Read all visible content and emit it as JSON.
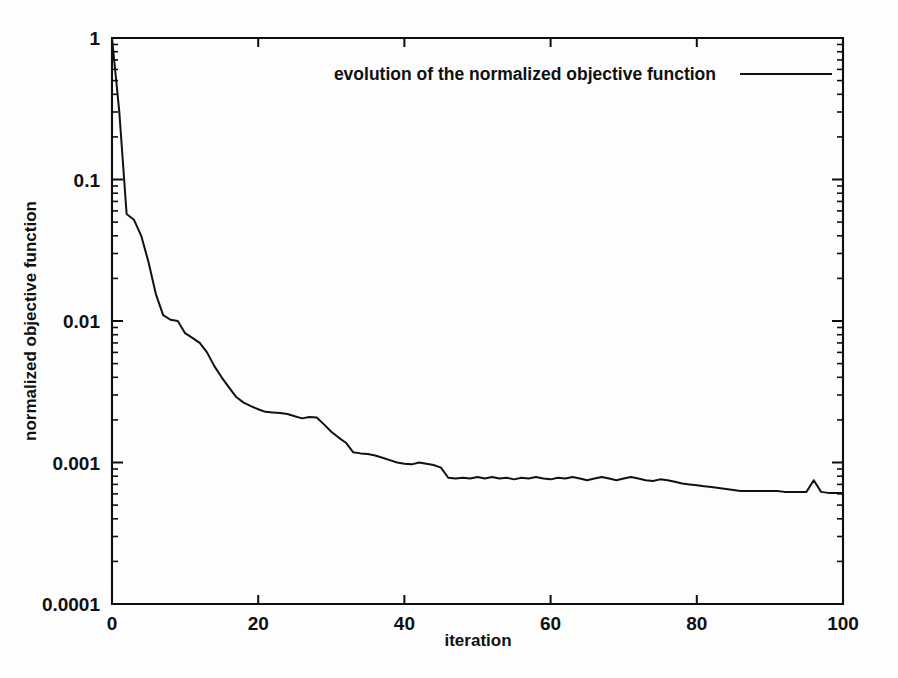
{
  "figure": {
    "background_color": "#fdfdfd",
    "line_color": "#111111",
    "axis_color": "#0d0d0d"
  },
  "chart_data": {
    "type": "line",
    "title": "",
    "subtitle": "",
    "xlabel": "iteration",
    "ylabel": "normalized objective function",
    "xlim": [
      0,
      100
    ],
    "ylim": [
      0.0001,
      1
    ],
    "yscale": "log",
    "xscale": "linear",
    "grid": false,
    "xticks": [
      0,
      20,
      40,
      60,
      80,
      100
    ],
    "xticklabels": [
      "0",
      "20",
      "40",
      "60",
      "80",
      "100"
    ],
    "yticks": [
      1,
      0.1,
      0.01,
      0.001,
      0.0001
    ],
    "yticklabels": [
      "1",
      "0.1",
      "0.01",
      "0.001",
      "0.0001"
    ],
    "legend": {
      "position": "top-right inside",
      "entries": [
        {
          "label": "evolution of the normalized objective function",
          "marker": "line",
          "color": "#111111"
        }
      ]
    },
    "series": [
      {
        "name": "evolution of the normalized objective function",
        "x": [
          0,
          1,
          2,
          3,
          4,
          5,
          6,
          7,
          8,
          9,
          10,
          11,
          12,
          13,
          14,
          15,
          16,
          17,
          18,
          19,
          20,
          21,
          22,
          23,
          24,
          25,
          26,
          27,
          28,
          29,
          30,
          31,
          32,
          33,
          34,
          35,
          36,
          37,
          38,
          39,
          40,
          41,
          42,
          43,
          44,
          45,
          46,
          47,
          48,
          49,
          50,
          51,
          52,
          53,
          54,
          55,
          56,
          57,
          58,
          59,
          60,
          61,
          62,
          63,
          64,
          65,
          66,
          67,
          68,
          69,
          70,
          71,
          72,
          73,
          74,
          75,
          76,
          77,
          78,
          79,
          80,
          81,
          82,
          83,
          84,
          85,
          86,
          87,
          88,
          89,
          90,
          91,
          92,
          93,
          94,
          95,
          96,
          97,
          98,
          99,
          100
        ],
        "y": [
          1.0,
          0.3,
          0.057,
          0.052,
          0.04,
          0.026,
          0.0155,
          0.011,
          0.0102,
          0.01,
          0.0082,
          0.0076,
          0.007,
          0.006,
          0.0048,
          0.004,
          0.0034,
          0.0029,
          0.00265,
          0.0025,
          0.00238,
          0.00228,
          0.00226,
          0.00224,
          0.0022,
          0.00212,
          0.00205,
          0.0021,
          0.00208,
          0.00186,
          0.00165,
          0.0015,
          0.00138,
          0.00118,
          0.00116,
          0.00115,
          0.00112,
          0.00108,
          0.00104,
          0.001,
          0.00098,
          0.00097,
          0.001,
          0.00098,
          0.00096,
          0.00092,
          0.00078,
          0.00077,
          0.00078,
          0.00077,
          0.00079,
          0.00077,
          0.00079,
          0.00077,
          0.00078,
          0.00076,
          0.00078,
          0.00077,
          0.00079,
          0.00077,
          0.00076,
          0.00078,
          0.00077,
          0.00079,
          0.00077,
          0.00075,
          0.00077,
          0.00079,
          0.00077,
          0.00075,
          0.00077,
          0.00079,
          0.00077,
          0.00075,
          0.00074,
          0.00076,
          0.00075,
          0.00073,
          0.00071,
          0.0007,
          0.00069,
          0.00068,
          0.00067,
          0.00066,
          0.00065,
          0.00064,
          0.00063,
          0.00063,
          0.00063,
          0.00063,
          0.00063,
          0.00063,
          0.00062,
          0.00062,
          0.00062,
          0.00062,
          0.00075,
          0.00062,
          0.00061,
          0.00061,
          0.00061
        ]
      }
    ]
  }
}
